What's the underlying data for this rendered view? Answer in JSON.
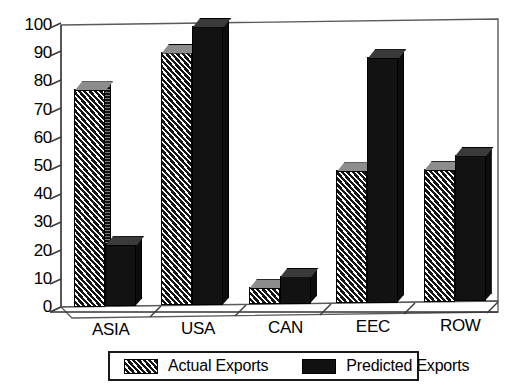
{
  "chart_data": {
    "type": "bar",
    "title": "",
    "subtitle": "",
    "xlabel": "",
    "ylabel": "",
    "categories": [
      "ASIA",
      "USA",
      "CAN",
      "EEC",
      "ROW"
    ],
    "series": [
      {
        "name": "Actual Exports",
        "values": [
          77,
          90,
          6,
          47,
          47
        ]
      },
      {
        "name": "Predicted Exports",
        "values": [
          22,
          99,
          10,
          87,
          52
        ]
      }
    ],
    "ylim": [
      0,
      100
    ],
    "yticks": [
      0,
      10,
      20,
      30,
      40,
      50,
      60,
      70,
      80,
      90,
      100
    ],
    "ytick_labels": [
      "0",
      "10",
      "20",
      "30",
      "40",
      "50",
      "60",
      "70",
      "80",
      "90",
      "100"
    ],
    "grid": false,
    "legend_position": "bottom",
    "legend": [
      {
        "label": "Actual Exports",
        "swatch": "hatched-diagonal",
        "color": "#2b2b2b"
      },
      {
        "label": "Predicted Exports",
        "swatch": "solid",
        "color": "#111111"
      }
    ],
    "style": {
      "three_d": true,
      "frame_color": "#555555",
      "background": "#ffffff"
    }
  }
}
